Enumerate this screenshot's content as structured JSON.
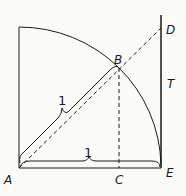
{
  "diagram": {
    "points": {
      "A": "A",
      "B": "B",
      "C": "C",
      "D": "D",
      "E": "E",
      "T": "T"
    },
    "measures": {
      "radius_label": "1",
      "base_label": "1"
    },
    "colors": {
      "stroke": "#1a1a1a",
      "background": "#fbfbf8"
    }
  }
}
